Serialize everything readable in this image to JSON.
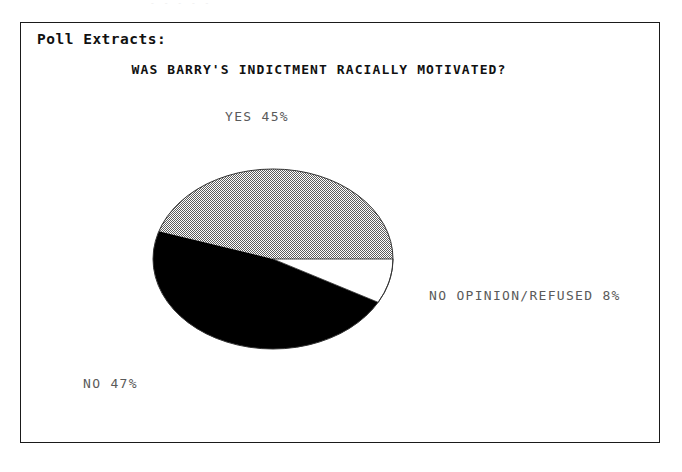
{
  "page": {
    "background": "#ffffff",
    "scan_artifact_text": "- -  -   -  -",
    "frame_border_color": "#1a1a1a"
  },
  "poll": {
    "heading": "Poll Extracts:"
  },
  "chart_data": {
    "type": "pie",
    "title": "WAS BARRY'S INDICTMENT RACIALLY MOTIVATED?",
    "xlabel": "",
    "ylabel": "",
    "legend_position": "none",
    "grid": false,
    "unit": "%",
    "categories": [
      "YES",
      "NO",
      "NO OPINION/REFUSED"
    ],
    "values": [
      45,
      47,
      8
    ],
    "labels": [
      "YES 45%",
      "NO 47%",
      "NO OPINION/REFUSED 8%"
    ],
    "slices": [
      {
        "name": "YES",
        "value": 45,
        "label": "YES 45%",
        "fill_style": "dither-checker-gray",
        "fill_color": "#9a9a9a",
        "start_angle_deg": 0,
        "end_angle_deg": 162,
        "direction": "counterclockwise"
      },
      {
        "name": "NO",
        "value": 47,
        "label": "NO 47%",
        "fill_style": "solid",
        "fill_color": "#000000",
        "start_angle_deg": 162,
        "end_angle_deg": 331.2,
        "direction": "counterclockwise"
      },
      {
        "name": "NO OPINION/REFUSED",
        "value": 8,
        "label": "NO OPINION/REFUSED 8%",
        "fill_style": "none",
        "fill_color": "#ffffff",
        "start_angle_deg": 331.2,
        "end_angle_deg": 360,
        "direction": "counterclockwise"
      }
    ],
    "geometry": {
      "center_x": 252,
      "center_y": 236,
      "radius_x": 120,
      "radius_y": 90,
      "outline_color": "#333333"
    }
  }
}
